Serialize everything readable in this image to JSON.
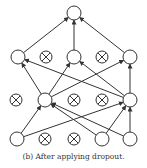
{
  "caption": "(b) After applying dropout.",
  "colors": {
    "stroke": "#333333",
    "background": "#ffffff"
  },
  "node_radius": 7,
  "layers": [
    {
      "name": "output",
      "nodes": [
        {
          "x": 74,
          "y": 13,
          "dropped": false
        }
      ]
    },
    {
      "name": "hidden-2",
      "nodes": [
        {
          "x": 18,
          "y": 57,
          "dropped": false
        },
        {
          "x": 46,
          "y": 57,
          "dropped": true
        },
        {
          "x": 74,
          "y": 57,
          "dropped": false
        },
        {
          "x": 102,
          "y": 57,
          "dropped": true
        },
        {
          "x": 130,
          "y": 57,
          "dropped": false
        }
      ]
    },
    {
      "name": "hidden-1",
      "nodes": [
        {
          "x": 16,
          "y": 100,
          "dropped": true
        },
        {
          "x": 45,
          "y": 100,
          "dropped": false
        },
        {
          "x": 74,
          "y": 100,
          "dropped": true
        },
        {
          "x": 102,
          "y": 100,
          "dropped": true
        },
        {
          "x": 130,
          "y": 100,
          "dropped": false
        }
      ]
    },
    {
      "name": "input",
      "nodes": [
        {
          "x": 17,
          "y": 139,
          "dropped": false
        },
        {
          "x": 45,
          "y": 139,
          "dropped": true
        },
        {
          "x": 74,
          "y": 139,
          "dropped": true
        },
        {
          "x": 102,
          "y": 139,
          "dropped": false
        },
        {
          "x": 130,
          "y": 139,
          "dropped": false
        }
      ]
    }
  ],
  "edges": [
    [
      [
        18,
        57
      ],
      [
        74,
        13
      ]
    ],
    [
      [
        74,
        57
      ],
      [
        74,
        13
      ]
    ],
    [
      [
        130,
        57
      ],
      [
        74,
        13
      ]
    ],
    [
      [
        45,
        100
      ],
      [
        18,
        57
      ]
    ],
    [
      [
        45,
        100
      ],
      [
        74,
        57
      ]
    ],
    [
      [
        45,
        100
      ],
      [
        130,
        57
      ]
    ],
    [
      [
        130,
        100
      ],
      [
        18,
        57
      ]
    ],
    [
      [
        130,
        100
      ],
      [
        74,
        57
      ]
    ],
    [
      [
        130,
        100
      ],
      [
        130,
        57
      ]
    ],
    [
      [
        17,
        139
      ],
      [
        45,
        100
      ]
    ],
    [
      [
        17,
        139
      ],
      [
        130,
        100
      ]
    ],
    [
      [
        102,
        139
      ],
      [
        45,
        100
      ]
    ],
    [
      [
        102,
        139
      ],
      [
        130,
        100
      ]
    ],
    [
      [
        130,
        139
      ],
      [
        45,
        100
      ]
    ],
    [
      [
        130,
        139
      ],
      [
        130,
        100
      ]
    ]
  ]
}
